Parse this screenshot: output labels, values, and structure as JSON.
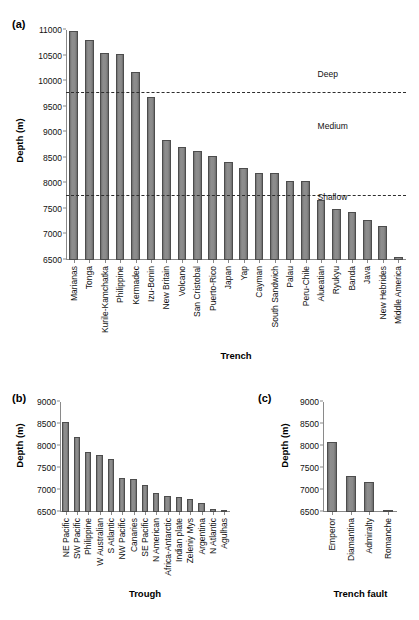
{
  "figure": {
    "panels": [
      "(a)",
      "(b)",
      "(c)"
    ],
    "axis_y_label": "Depth (m)"
  },
  "chart_data": [
    {
      "type": "bar",
      "panel": "(a)",
      "title": "",
      "xlabel": "Trench",
      "ylabel": "Depth (m)",
      "ylim": [
        6500,
        11000
      ],
      "yticks": [
        6500,
        7000,
        7500,
        8000,
        8500,
        9000,
        9500,
        10000,
        10500,
        11000
      ],
      "grid": false,
      "legend": "none",
      "categories": [
        "Marianas",
        "Tonga",
        "Kurile-Kamchatka",
        "Philippine",
        "Kermadec",
        "Izu-Bonin",
        "New Britain",
        "Volcano",
        "San Cristobal",
        "Puerto-Rico",
        "Japan",
        "Yap",
        "Cayman",
        "South Sandwich",
        "Palau",
        "Peru-Chile",
        "Alueatian",
        "Ryukyu",
        "Banda",
        "Java",
        "New Hebrides",
        "Middle America"
      ],
      "values": [
        10984,
        10800,
        10542,
        10540,
        10177,
        9695,
        8844,
        8718,
        8641,
        8526,
        8412,
        8292,
        8205,
        8202,
        8054,
        8055,
        7679,
        7507,
        7440,
        7290,
        7156,
        6560
      ],
      "annotations": [
        {
          "label": "Deep",
          "y": 10000
        },
        {
          "label": "Medium",
          "y": 8980
        },
        {
          "label": "Shallow",
          "y": 7600
        }
      ],
      "reference_lines": [
        {
          "value": 9760,
          "style": "dashed"
        },
        {
          "value": 7750,
          "style": "dashed"
        }
      ]
    },
    {
      "type": "bar",
      "panel": "(b)",
      "title": "",
      "xlabel": "Trough",
      "ylabel": "Depth (m)",
      "ylim": [
        6500,
        9000
      ],
      "yticks": [
        6500,
        7000,
        7500,
        8000,
        8500,
        9000
      ],
      "grid": false,
      "legend": "none",
      "categories": [
        "NE Pacific",
        "SW Pacific",
        "Philippine",
        "W Australian",
        "S Atlantic",
        "NW Pacific",
        "Canaries",
        "SE Pacific",
        "N American",
        "Africa-Antarctic",
        "Indian plate",
        "Zeleniy Mys",
        "Argentina",
        "N Atlantic",
        "Agulhas"
      ],
      "values": [
        8550,
        8210,
        7874,
        7785,
        7715,
        7270,
        7245,
        7120,
        6940,
        6875,
        6840,
        6805,
        6710,
        6570,
        6520
      ]
    },
    {
      "type": "bar",
      "panel": "(c)",
      "title": "",
      "xlabel": "Trench fault",
      "ylabel": "Depth (m)",
      "ylim": [
        6500,
        9000
      ],
      "yticks": [
        6500,
        7000,
        7500,
        8000,
        8500,
        9000
      ],
      "grid": false,
      "legend": "none",
      "categories": [
        "Emperor",
        "Diamantina",
        "Admiralty",
        "Romanche"
      ],
      "values": [
        8100,
        7320,
        7180,
        6550
      ]
    }
  ]
}
